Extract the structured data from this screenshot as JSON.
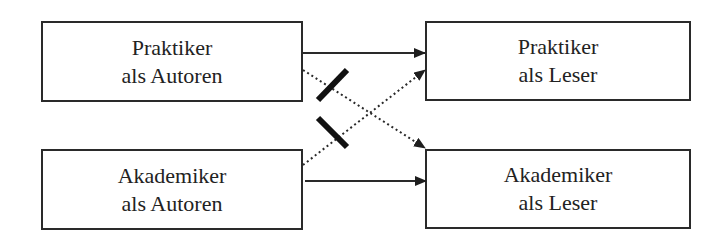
{
  "diagram": {
    "nodes": [
      {
        "id": "praktiker-autoren",
        "line1": "Praktiker",
        "line2": "als Autoren"
      },
      {
        "id": "akademiker-autoren",
        "line1": "Akademiker",
        "line2": "als Autoren"
      },
      {
        "id": "praktiker-leser",
        "line1": "Praktiker",
        "line2": "als Leser"
      },
      {
        "id": "akademiker-leser",
        "line1": "Akademiker",
        "line2": "als Leser"
      }
    ],
    "edges": [
      {
        "from": "praktiker-autoren",
        "to": "praktiker-leser",
        "style": "solid",
        "blocked": false
      },
      {
        "from": "praktiker-autoren",
        "to": "akademiker-leser",
        "style": "dotted",
        "blocked": true
      },
      {
        "from": "akademiker-autoren",
        "to": "praktiker-leser",
        "style": "dotted",
        "blocked": true
      },
      {
        "from": "akademiker-autoren",
        "to": "akademiker-leser",
        "style": "solid",
        "blocked": false
      }
    ],
    "colors": {
      "stroke": "#2a2a2a",
      "background": "#ffffff"
    }
  }
}
